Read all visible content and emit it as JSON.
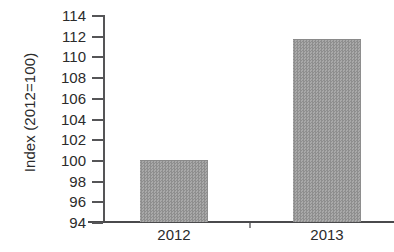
{
  "chart_data": {
    "type": "bar",
    "title": "",
    "subtitle": "",
    "xlabel": "",
    "ylabel": "Index (2012=100)",
    "categories": [
      "2012",
      "2013"
    ],
    "values": [
      100.0,
      111.7
    ],
    "series": [
      {
        "name": "Index (2012=100)",
        "values": [
          100.0,
          111.7
        ]
      }
    ],
    "ylim": [
      94,
      114
    ],
    "ytick_labels": [
      "114",
      "112",
      "110",
      "108",
      "106",
      "104",
      "102",
      "100",
      "98",
      "96",
      "94"
    ],
    "ytick_values": [
      114,
      112,
      110,
      108,
      106,
      104,
      102,
      100,
      98,
      96,
      94
    ],
    "ytick_step": 2,
    "xtick_labels": [
      "2012",
      "2013"
    ],
    "grid": false,
    "legend": false,
    "legend_position": "none",
    "annotations": [],
    "bar_color": "#9b9b9b",
    "axis_color": "#4a4a4c",
    "text_color": "#2b2b2b",
    "background_color": "#ffffff"
  }
}
